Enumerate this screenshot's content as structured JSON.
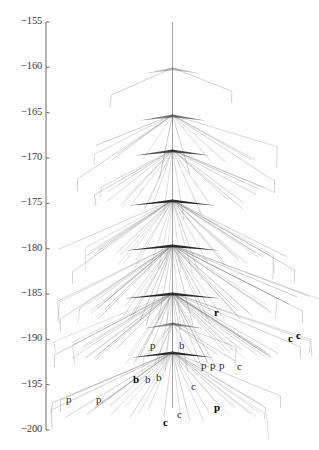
{
  "figure": {
    "type": "transmission-tree",
    "background_color": "#ffffff",
    "line_color": "#777777",
    "axis_color": "#6b6b6b",
    "width": 319,
    "height": 450
  },
  "axis": {
    "orientation": "vertical-left",
    "x_px": 46,
    "top_px": 22,
    "bottom_px": 430,
    "domain": [
      -155,
      -200
    ],
    "tick_labels": [
      "-155",
      "-160",
      "-165",
      "-170",
      "-175",
      "-180",
      "-185",
      "-190",
      "-195",
      "-200"
    ],
    "tick_values": [
      -155,
      -160,
      -165,
      -170,
      -175,
      -180,
      -185,
      -190,
      -195,
      -200
    ]
  },
  "chart_data": {
    "type": "tree",
    "title": "",
    "xlabel": "",
    "ylabel": "",
    "ylim": [
      -200,
      -155
    ],
    "axis_ticks": [
      -155,
      -160,
      -165,
      -170,
      -175,
      -180,
      -185,
      -190,
      -195,
      -200
    ],
    "trunk_x": 172.5,
    "root_y": -155,
    "internal_nodes": [
      {
        "id": "n0",
        "y": -160.1,
        "y_px": 68,
        "x_px": 172.5,
        "n_children": 3
      },
      {
        "id": "n1",
        "y": -165.3,
        "y_px": 115,
        "x_px": 172.5,
        "n_children": 12
      },
      {
        "id": "n2",
        "y": -169.1,
        "y_px": 150,
        "x_px": 172.5,
        "n_children": 20
      },
      {
        "id": "n3",
        "y": -174.6,
        "y_px": 200,
        "x_px": 172.5,
        "n_children": 30
      },
      {
        "id": "n4",
        "y": -179.6,
        "y_px": 245,
        "x_px": 172.5,
        "n_children": 38
      },
      {
        "id": "n5",
        "y": -184.9,
        "y_px": 293,
        "x_px": 172.5,
        "n_children": 40
      },
      {
        "id": "n6",
        "y": -188.2,
        "y_px": 323,
        "x_px": 172.5,
        "n_children": 9
      },
      {
        "id": "n7",
        "y": -191.4,
        "y_px": 352,
        "x_px": 172.5,
        "n_children": 26
      }
    ],
    "tip_labels": [
      {
        "text": "r",
        "x_px": 214,
        "y_px": 313,
        "bold": true
      },
      {
        "text": "c",
        "x_px": 288,
        "y_px": 339,
        "bold": true
      },
      {
        "text": "c",
        "x_px": 296,
        "y_px": 336,
        "bold": true
      },
      {
        "text": "p",
        "x_px": 150,
        "y_px": 346,
        "bold": false
      },
      {
        "text": "b",
        "x_px": 179,
        "y_px": 346,
        "bold": false
      },
      {
        "text": "p",
        "x_px": 201,
        "y_px": 366,
        "bold": false
      },
      {
        "text": "p",
        "x_px": 210,
        "y_px": 366,
        "bold": false
      },
      {
        "text": "p",
        "x_px": 219,
        "y_px": 366,
        "bold": false
      },
      {
        "text": "c",
        "x_px": 237,
        "y_px": 367,
        "bold": false
      },
      {
        "text": "b",
        "x_px": 133,
        "y_px": 380,
        "bold": true
      },
      {
        "text": "b",
        "x_px": 145,
        "y_px": 380,
        "bold": false
      },
      {
        "text": "b",
        "x_px": 156,
        "y_px": 378,
        "bold": false
      },
      {
        "text": "c",
        "x_px": 191,
        "y_px": 387,
        "bold": false
      },
      {
        "text": "p",
        "x_px": 66,
        "y_px": 400,
        "bold": false
      },
      {
        "text": "p",
        "x_px": 96,
        "y_px": 400,
        "bold": false
      },
      {
        "text": "p",
        "x_px": 214,
        "y_px": 408,
        "bold": true
      },
      {
        "text": "c",
        "x_px": 177,
        "y_px": 415,
        "bold": false
      },
      {
        "text": "c",
        "x_px": 163,
        "y_px": 423,
        "bold": true
      }
    ]
  }
}
